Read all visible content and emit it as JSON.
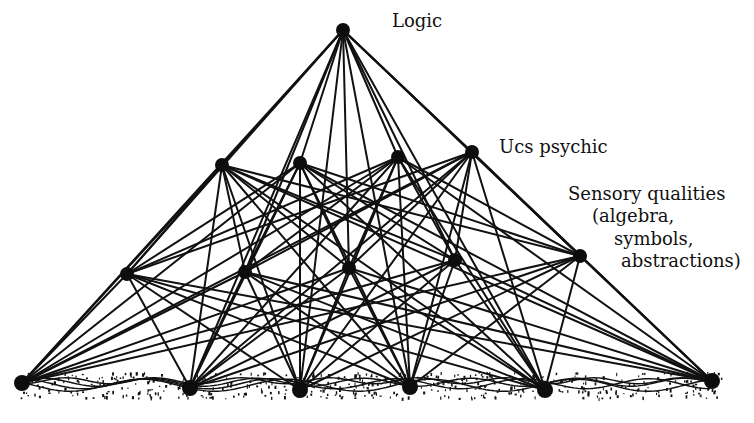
{
  "diagram": {
    "labels": {
      "logic": "Logic",
      "ucs": "Ucs psychic",
      "sensory_line1": "Sensory qualities",
      "sensory_line2": "(algebra,",
      "sensory_line3": "symbols,",
      "sensory_line4": "abstractions)"
    },
    "colors": {
      "ink": "#111111",
      "paper": "#ffffff"
    },
    "layers": [
      {
        "name": "logic",
        "nodes": [
          [
            343,
            30
          ]
        ]
      },
      {
        "name": "ucs-psychic",
        "nodes": [
          [
            222,
            165
          ],
          [
            300,
            163
          ],
          [
            398,
            157
          ],
          [
            472,
            152
          ]
        ]
      },
      {
        "name": "sensory-qualities",
        "nodes": [
          [
            127,
            274
          ],
          [
            245,
            272
          ],
          [
            349,
            268
          ],
          [
            455,
            260
          ],
          [
            580,
            256
          ]
        ]
      },
      {
        "name": "ground",
        "nodes": [
          [
            22,
            383
          ],
          [
            190,
            388
          ],
          [
            300,
            390
          ],
          [
            410,
            387
          ],
          [
            545,
            390
          ],
          [
            712,
            381
          ]
        ]
      }
    ]
  }
}
